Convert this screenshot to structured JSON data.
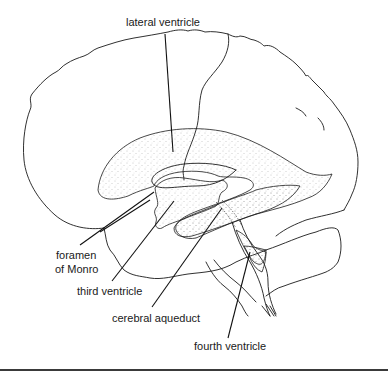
{
  "figure": {
    "colors": {
      "line": "#1a1a1a",
      "stipple": "#9a9a9a",
      "background": "#ffffff",
      "rule": "#3a3a3a"
    },
    "labels": {
      "lateral_ventricle": "lateral ventricle",
      "foramen_line1": "foramen",
      "foramen_line2": "of Monro",
      "third_ventricle": "third ventricle",
      "cerebral_aqueduct": "cerebral aqueduct",
      "fourth_ventricle": "fourth ventricle"
    }
  }
}
